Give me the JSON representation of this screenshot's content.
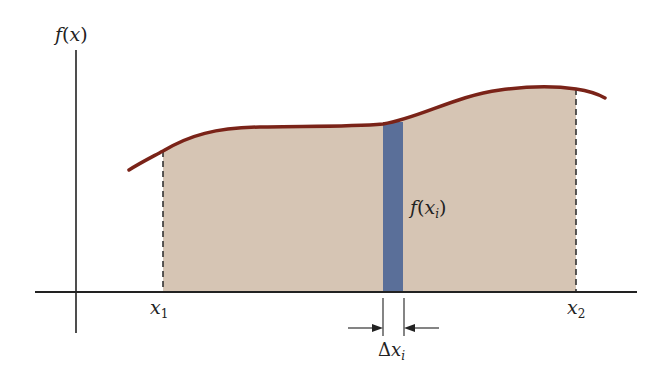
{
  "diagram": {
    "type": "area-under-curve",
    "labels": {
      "y_axis": {
        "f": "f",
        "open": "(",
        "var": "x",
        "close": ")"
      },
      "x1": {
        "base": "x",
        "sub": "1"
      },
      "x2": {
        "base": "x",
        "sub": "2"
      },
      "strip_height": {
        "f": "f",
        "open": "(",
        "var": "x",
        "sub": "i",
        "close": ")"
      },
      "strip_width": {
        "delta": "Δ",
        "var": "x",
        "sub": "i"
      }
    },
    "colors": {
      "area_fill": "#d6c5b4",
      "curve": "#7a2318",
      "strip": "#5a6f99",
      "axis": "#222222",
      "dashed": "#333333"
    }
  }
}
